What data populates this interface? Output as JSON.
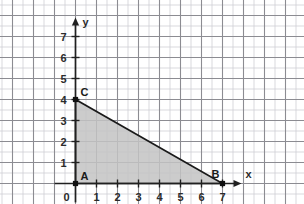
{
  "figure": {
    "background_color": "#ffffff",
    "width": 304,
    "height": 204
  },
  "grid": {
    "major_color": "#8c8c92",
    "minor_color": "#cfcfd4",
    "major_spacing_units": 1,
    "minor_divisions": 2,
    "visible": true
  },
  "axes": {
    "x": {
      "label": "x",
      "color": "#202020",
      "arrow": true,
      "ticks": [
        "1",
        "2",
        "3",
        "4",
        "5",
        "6",
        "7"
      ],
      "min": -1,
      "max": 8
    },
    "y": {
      "label": "y",
      "color": "#202020",
      "arrow": true,
      "ticks": [
        "1",
        "2",
        "3",
        "4",
        "5",
        "6",
        "7"
      ],
      "min": -1,
      "max": 8
    },
    "origin_label": "0"
  },
  "chart_data": {
    "type": "scatter",
    "xlabel": "x",
    "ylabel": "y",
    "xlim": [
      -1,
      8
    ],
    "ylim": [
      -1,
      8
    ],
    "xticks": [
      1,
      2,
      3,
      4,
      5,
      6,
      7
    ],
    "yticks": [
      1,
      2,
      3,
      4,
      5,
      6,
      7
    ],
    "grid": true,
    "legend": "none",
    "shapes": [
      {
        "name": "triangle-ABC",
        "kind": "polygon",
        "closed": true,
        "fill": "#c3c3c3",
        "fill_opacity": 0.85,
        "stroke": "#1a1a1a",
        "stroke_width": 1.6,
        "points": [
          {
            "label": "A",
            "x": 0,
            "y": 0
          },
          {
            "label": "B",
            "x": 7,
            "y": 0
          },
          {
            "label": "C",
            "x": 0,
            "y": 4
          }
        ]
      }
    ],
    "vertices": [
      {
        "label": "A",
        "x": 0,
        "y": 0,
        "label_dx": 5,
        "label_dy": -4,
        "marker": "dot"
      },
      {
        "label": "B",
        "x": 7,
        "y": 0,
        "label_dx": -11,
        "label_dy": -6,
        "marker": "dot"
      },
      {
        "label": "C",
        "x": 0,
        "y": 4,
        "label_dx": 5,
        "label_dy": -4,
        "marker": "dot"
      }
    ],
    "segments": [
      {
        "name": "leg-AB",
        "from": "A",
        "to": "B",
        "length": 7
      },
      {
        "name": "leg-AC",
        "from": "A",
        "to": "C",
        "length": 4
      },
      {
        "name": "hypotenuse-CB",
        "from": "C",
        "to": "B",
        "length": 8.06
      }
    ]
  }
}
